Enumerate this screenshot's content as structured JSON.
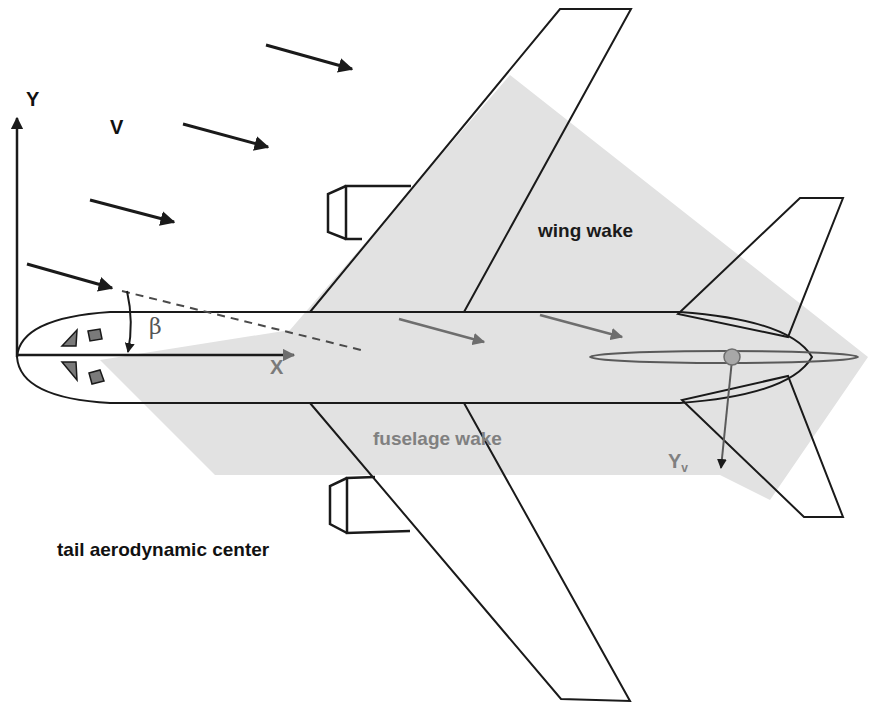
{
  "diagram": {
    "title_labels": {
      "y_axis": "Y",
      "x_axis": "X",
      "velocity": "V",
      "sideslip_angle": "β",
      "wing_wake": "wing wake",
      "fuselage_wake": "fuselage wake",
      "side_force": "Y",
      "side_force_subscript": "v",
      "tail_ac": "tail aerodynamic center"
    },
    "colors": {
      "outline": "#1a1a1a",
      "wake_fill": "#e2e2e2",
      "wake_text": "#808080",
      "in_wake_arrow": "#6e6e6e",
      "window_fill": "#7a7a7a",
      "tail_ac_marker": "#a8a8a8",
      "background": "#ffffff"
    },
    "freestream_arrows": [
      {
        "x1": 266,
        "y1": 45,
        "x2": 352,
        "y2": 69
      },
      {
        "x1": 183,
        "y1": 124,
        "x2": 268,
        "y2": 147
      },
      {
        "x1": 90,
        "y1": 200,
        "x2": 174,
        "y2": 222
      },
      {
        "x1": 27,
        "y1": 264,
        "x2": 112,
        "y2": 288
      }
    ],
    "wake_arrows": [
      {
        "x1": 399,
        "y1": 319,
        "x2": 484,
        "y2": 342
      },
      {
        "x1": 540,
        "y1": 315,
        "x2": 622,
        "y2": 337
      }
    ]
  }
}
